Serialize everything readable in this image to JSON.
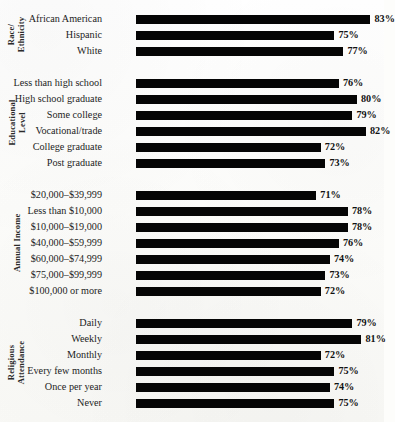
{
  "chart_data": {
    "type": "bar",
    "orientation": "horizontal",
    "title": "",
    "subtitle": "",
    "xlabel": "",
    "ylabel": "",
    "grid": false,
    "legend": null,
    "value_suffix": "%",
    "xlim": [
      31,
      86
    ],
    "bar_color": "#050505",
    "background_color": "#fdfdfb",
    "groups": [
      {
        "label": "Race/\nEthnicity",
        "label_lines": [
          "Race/",
          "Ethnicity"
        ],
        "categories": [
          "African American",
          "Hispanic",
          "White"
        ],
        "values": [
          83,
          75,
          77
        ],
        "value_labels": [
          "83%",
          "75%",
          "77%"
        ]
      },
      {
        "label": "Educational\nLevel",
        "label_lines": [
          "Educational",
          "Level"
        ],
        "categories": [
          "Less than high school",
          "High school graduate",
          "Some college",
          "Vocational/trade",
          "College graduate",
          "Post graduate"
        ],
        "values": [
          76,
          80,
          79,
          82,
          72,
          73
        ],
        "value_labels": [
          "76%",
          "80%",
          "79%",
          "82%",
          "72%",
          "73%"
        ]
      },
      {
        "label": "Annual Income",
        "label_lines": [
          "Annual Income"
        ],
        "categories": [
          "$20,000–$39,999",
          "Less than $10,000",
          "$10,000–$19,000",
          "$40,000–$59,999",
          "$60,000–$74,999",
          "$75,000–$99,999",
          "$100,000 or more"
        ],
        "values": [
          71,
          78,
          78,
          76,
          74,
          73,
          72
        ],
        "value_labels": [
          "71%",
          "78%",
          "78%",
          "76%",
          "74%",
          "73%",
          "72%"
        ]
      },
      {
        "label": "Religious\nAttendance",
        "label_lines": [
          "Religious",
          "Attendance"
        ],
        "categories": [
          "Daily",
          "Weekly",
          "Monthly",
          "Every few months",
          "Once per year",
          "Never"
        ],
        "values": [
          79,
          81,
          72,
          75,
          74,
          75
        ],
        "value_labels": [
          "79%",
          "81%",
          "72%",
          "75%",
          "74%",
          "75%"
        ]
      }
    ]
  }
}
